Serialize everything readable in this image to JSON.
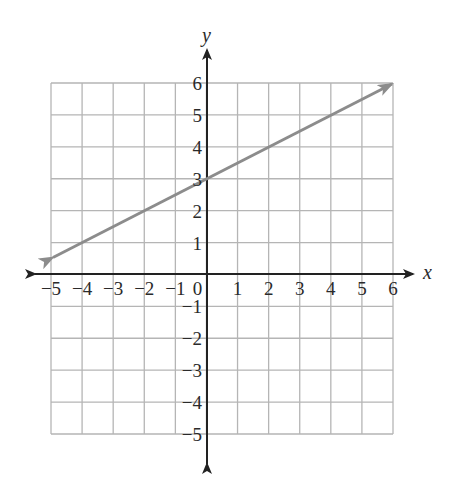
{
  "chart_data": {
    "type": "line",
    "title": "",
    "xlabel": "x",
    "ylabel": "y",
    "xlim": [
      -5,
      6
    ],
    "ylim": [
      -5,
      6
    ],
    "grid": true,
    "x_ticks": [
      "−5",
      "−4",
      "−3",
      "−2",
      "−1",
      "0",
      "1",
      "2",
      "3",
      "4",
      "5",
      "6"
    ],
    "y_ticks": [
      "6",
      "5",
      "4",
      "3",
      "2",
      "1",
      "−1",
      "−2",
      "−3",
      "−4",
      "−5"
    ],
    "series": [
      {
        "name": "line",
        "equation": "y = 0.5x + 3",
        "x": [
          -5,
          0,
          2,
          4,
          6
        ],
        "y": [
          0.5,
          3,
          4,
          5,
          6
        ],
        "arrows": "both",
        "color": "#8c8c8c"
      }
    ],
    "colors": {
      "grid": "#b5b5b5",
      "axes": "#222222",
      "line": "#8c8c8c"
    }
  }
}
